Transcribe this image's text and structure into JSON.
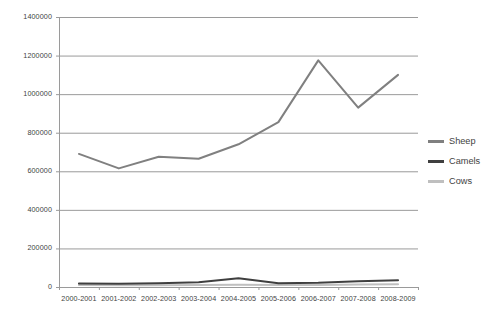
{
  "chart_data": {
    "type": "line",
    "title": "",
    "subtitle": "",
    "xlabel": "",
    "ylabel": "",
    "categories": [
      "2000-2001",
      "2001-2002",
      "2002-2003",
      "2003-2004",
      "2004-2005",
      "2005-2006",
      "2006-2007",
      "2007-2008",
      "2008-2009"
    ],
    "ylim": [
      0,
      1400000
    ],
    "ytick_step": 200000,
    "yticks": [
      "0",
      "200000",
      "400000",
      "600000",
      "800000",
      "1000000",
      "1200000",
      "1400000"
    ],
    "ytick_values": [
      0,
      200000,
      400000,
      600000,
      800000,
      1000000,
      1200000,
      1400000
    ],
    "grid": true,
    "legend_position": "right",
    "series": [
      {
        "name": "Sheep",
        "color": "#808080",
        "values": [
          690000,
          615000,
          675000,
          665000,
          740000,
          855000,
          1175000,
          930000,
          1100000
        ]
      },
      {
        "name": "Camels",
        "color": "#3f3f3f",
        "values": [
          18000,
          17000,
          20000,
          25000,
          45000,
          20000,
          22000,
          30000,
          35000
        ]
      },
      {
        "name": "Cows",
        "color": "#bfbfbf",
        "values": [
          10000,
          9000,
          9000,
          10000,
          12000,
          10000,
          11000,
          13000,
          14000
        ]
      }
    ]
  },
  "colors": {
    "grid": "#9a9a9a",
    "axis": "#9a9a9a",
    "text": "#3f3f3f",
    "background": "#ffffff"
  }
}
